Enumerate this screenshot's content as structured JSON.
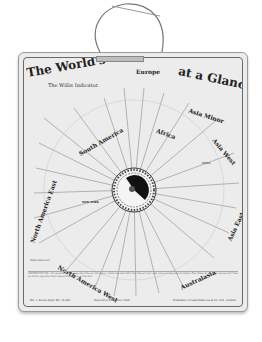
{
  "card": {
    "title_left": "The World's Time",
    "title_right": "at a Glance",
    "subtitle": "The Willis Indicator.",
    "regions": [
      {
        "label": "Europe",
        "x": 120,
        "y": 12,
        "rot": 0
      },
      {
        "label": "Africa",
        "x": 132,
        "y": 72,
        "rot": 20
      },
      {
        "label": "Asia Minor",
        "x": 166,
        "y": 52,
        "rot": 18
      },
      {
        "label": "Asia West",
        "x": 192,
        "y": 88,
        "rot": 50
      },
      {
        "label": "Asia East",
        "x": 200,
        "y": 160,
        "rot": -65
      },
      {
        "label": "Australasia",
        "x": 160,
        "y": 220,
        "rot": -25
      },
      {
        "label": "North America West",
        "x": 38,
        "y": 226,
        "rot": 30
      },
      {
        "label": "South America",
        "x": 52,
        "y": 80,
        "rot": -30
      },
      {
        "label": "North America East",
        "x": 6,
        "y": 150,
        "rot": -70
      }
    ],
    "cities_visible": [
      "NEW YORK",
      "INDIA"
    ],
    "dial": {
      "hub_color": "#111111",
      "ring_color": "#333333"
    },
    "instructions": "INSTRUCTIONS.—To ascertain with ease the time at any place, rotate the dial until the time at your own place is opposite its name. The times at all other places will then be found opposite their respective names on the dial.",
    "footer_left": "No. 1. Patent Appl. No. 18,493",
    "footer_mid": "Entered at Stationers' Hall",
    "footer_right": "Publishers: Frank Pinkerton & Co. Ltd., London",
    "note": "Willis Indicator"
  },
  "colors": {
    "card_bg": "#ececec",
    "ink": "#222222",
    "background": "#ffffff"
  }
}
